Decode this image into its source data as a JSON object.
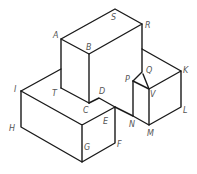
{
  "diagram": {
    "title": "",
    "type": "isometric-solid",
    "line_color": "#1a1a1a",
    "label_color": "#555555",
    "vertices": {
      "A": [
        61,
        39
      ],
      "B": [
        89,
        54
      ],
      "S": [
        115,
        9
      ],
      "R": [
        142,
        24
      ],
      "C": [
        89,
        103
      ],
      "D": [
        99,
        98
      ],
      "T": [
        61,
        88
      ],
      "I": [
        21,
        91
      ],
      "H": [
        21,
        127
      ],
      "Gt": [
        82,
        125
      ],
      "G": [
        82,
        162
      ],
      "E": [
        115,
        107
      ],
      "F": [
        115,
        143
      ],
      "Rb": [
        142,
        49
      ],
      "Qb": [
        142,
        72
      ],
      "Q": [
        143,
        74
      ],
      "P": [
        133,
        81
      ],
      "V": [
        149,
        89
      ],
      "K": [
        181,
        71
      ],
      "L": [
        181,
        107
      ],
      "M": [
        149,
        125
      ],
      "N": [
        133,
        116
      ],
      "At": [
        61,
        69
      ]
    },
    "labels": [
      {
        "text": "A",
        "x": 53,
        "y": 38
      },
      {
        "text": "B",
        "x": 86,
        "y": 50
      },
      {
        "text": "S",
        "x": 111,
        "y": 20
      },
      {
        "text": "R",
        "x": 145,
        "y": 28
      },
      {
        "text": "T",
        "x": 52,
        "y": 96
      },
      {
        "text": "C",
        "x": 83,
        "y": 113
      },
      {
        "text": "D",
        "x": 99,
        "y": 94
      },
      {
        "text": "E",
        "x": 103,
        "y": 124
      },
      {
        "text": "F",
        "x": 117,
        "y": 147
      },
      {
        "text": "G",
        "x": 84,
        "y": 150
      },
      {
        "text": "I",
        "x": 14,
        "y": 92
      },
      {
        "text": "H",
        "x": 9,
        "y": 131
      },
      {
        "text": "P",
        "x": 125,
        "y": 82
      },
      {
        "text": "Q",
        "x": 146,
        "y": 73
      },
      {
        "text": "V",
        "x": 150,
        "y": 97
      },
      {
        "text": "K",
        "x": 183,
        "y": 73
      },
      {
        "text": "L",
        "x": 183,
        "y": 113
      },
      {
        "text": "M",
        "x": 147,
        "y": 136
      },
      {
        "text": "N",
        "x": 129,
        "y": 127
      }
    ]
  }
}
